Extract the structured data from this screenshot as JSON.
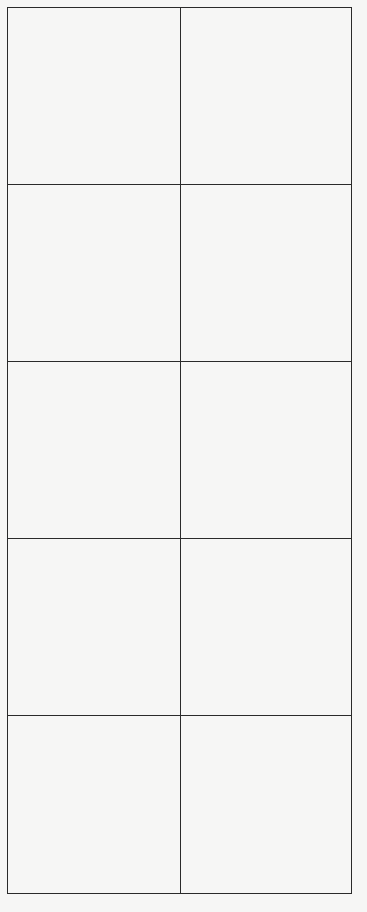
{
  "grid": {
    "columns": 2,
    "rows": 5,
    "line_color": "#2a2a2a",
    "background_color": "#f6f6f5",
    "cells": [
      [
        "",
        ""
      ],
      [
        "",
        ""
      ],
      [
        "",
        ""
      ],
      [
        "",
        ""
      ],
      [
        "",
        ""
      ]
    ]
  }
}
